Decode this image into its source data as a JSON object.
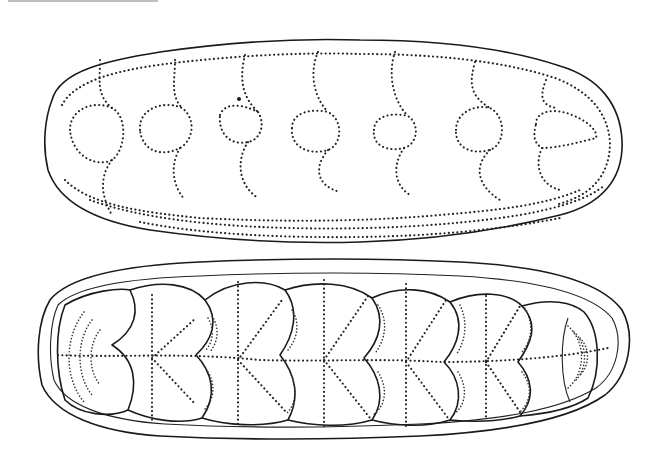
{
  "figure": {
    "background_color": "#ffffff",
    "ink_color": "#1a1a1a",
    "panels": [
      {
        "id": "upper",
        "view": "exterior outline with dotted lobe/segment markings",
        "segment_count": 7
      },
      {
        "id": "lower",
        "view": "interior showing nested overlapping valves with radiating dotted lines",
        "segment_count": 7
      }
    ]
  }
}
